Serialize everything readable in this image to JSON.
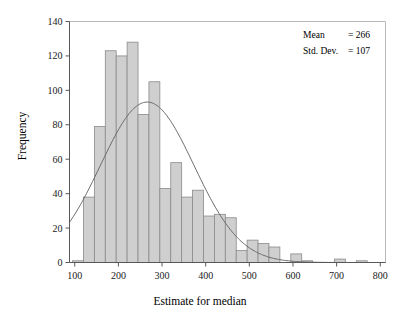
{
  "chart_data": {
    "type": "bar",
    "title": "",
    "subtitle": "",
    "xlabel": "Estimate for median",
    "ylabel": "Frequency",
    "xlim": [
      88,
      812
    ],
    "ylim": [
      0,
      140
    ],
    "xticks": [
      100,
      200,
      300,
      400,
      500,
      600,
      700,
      800
    ],
    "yticks": [
      0,
      20,
      40,
      60,
      80,
      100,
      120,
      140
    ],
    "grid": false,
    "legend": null,
    "bin_width": 25,
    "bin_starts": [
      95,
      120,
      145,
      170,
      195,
      220,
      245,
      270,
      295,
      320,
      345,
      370,
      395,
      420,
      445,
      470,
      495,
      520,
      545,
      570,
      595,
      620,
      645,
      670,
      695,
      720,
      745
    ],
    "categories": [
      "95-120",
      "120-145",
      "145-170",
      "170-195",
      "195-220",
      "220-245",
      "245-270",
      "270-295",
      "295-320",
      "320-345",
      "345-370",
      "370-395",
      "395-420",
      "420-445",
      "445-470",
      "470-495",
      "495-520",
      "520-545",
      "545-570",
      "570-595",
      "595-620",
      "620-645",
      "645-670",
      "670-695",
      "695-720",
      "720-745",
      "745-770"
    ],
    "values": [
      1,
      38,
      79,
      123,
      120,
      128,
      86,
      105,
      43,
      58,
      38,
      42,
      27,
      28,
      26,
      7,
      13,
      11,
      9,
      0,
      5,
      1,
      0,
      0,
      2,
      0,
      1
    ],
    "overlay": {
      "type": "normal-curve",
      "mean": 266,
      "std_dev": 107,
      "scale_n": 1000,
      "bin_width": 25
    },
    "annotations": [
      {
        "label": "Mean",
        "separator": "=",
        "value": "266"
      },
      {
        "label": "Std. Dev.",
        "separator": "=",
        "value": "107"
      }
    ],
    "colors": {
      "bar_fill": "#cfcfcf",
      "bar_stroke": "#8a8a8c",
      "curve": "#6a6a6c",
      "axis": "#58585a",
      "frame": "#b9b9bb",
      "text": "#1a1a1a",
      "background": "#ffffff"
    }
  },
  "annotation_box": {
    "mean_label": "Mean",
    "mean_eq": "= 266",
    "sd_label": "Std. Dev.",
    "sd_eq": "= 107"
  },
  "axes": {
    "x_title": "Estimate for median",
    "y_title": "Frequency"
  }
}
